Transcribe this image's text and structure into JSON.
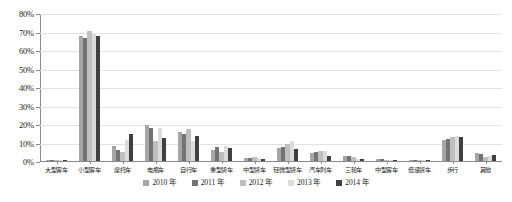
{
  "chart_data": {
    "type": "bar",
    "title": "",
    "subtitle": "",
    "xlabel": "",
    "ylabel": "",
    "ylim": [
      0,
      0.8
    ],
    "grid": true,
    "legend_position": "bottom",
    "y_tick_labels": [
      "80%",
      "70%",
      "60%",
      "50%",
      "40%",
      "30%",
      "20%",
      "10%",
      "0%"
    ],
    "y_tick_values": [
      0.8,
      0.7,
      0.6,
      0.5,
      0.4,
      0.3,
      0.2,
      0.1,
      0.0
    ],
    "categories": [
      "大型客车",
      "小型客车",
      "摩托车",
      "电瓶车",
      "自行车",
      "重型货车",
      "中型货车",
      "轻微型货车",
      "汽车列车",
      "三轮车",
      "中型客车",
      "低速货车",
      "步行",
      "其他"
    ],
    "series": [
      {
        "name": "2010 年",
        "color": "#a6a6a6",
        "values": [
          0.004,
          0.68,
          0.08,
          0.197,
          0.16,
          0.062,
          0.018,
          0.07,
          0.044,
          0.03,
          0.01,
          0.007,
          0.112,
          0.041
        ]
      },
      {
        "name": "2011 年",
        "color": "#737373",
        "values": [
          0.004,
          0.672,
          0.062,
          0.182,
          0.146,
          0.075,
          0.016,
          0.078,
          0.049,
          0.025,
          0.009,
          0.006,
          0.118,
          0.038
        ]
      },
      {
        "name": "2012 年",
        "color": "#bfbfbf",
        "values": [
          0.004,
          0.71,
          0.05,
          0.108,
          0.175,
          0.05,
          0.02,
          0.09,
          0.052,
          0.021,
          0.008,
          0.006,
          0.128,
          0.022
        ]
      },
      {
        "name": "2013 年",
        "color": "#dcdcdc",
        "values": [
          0.004,
          0.69,
          0.112,
          0.18,
          0.11,
          0.083,
          0.014,
          0.111,
          0.055,
          0.012,
          0.007,
          0.005,
          0.134,
          0.028
        ]
      },
      {
        "name": "2014 年",
        "color": "#404040",
        "values": [
          0.005,
          0.682,
          0.148,
          0.126,
          0.138,
          0.071,
          0.013,
          0.068,
          0.03,
          0.009,
          0.006,
          0.005,
          0.132,
          0.034
        ]
      }
    ]
  }
}
